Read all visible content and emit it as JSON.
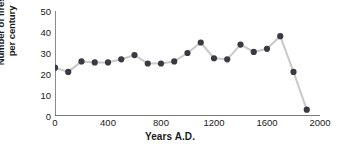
{
  "chart_data": {
    "type": "line",
    "title": "",
    "subtitle": "",
    "xlabel": "Years A.D.",
    "ylabel": "Number of fires per century",
    "ylabel_line1": "Number of fires",
    "ylabel_line2": "per century",
    "xlim": [
      0,
      2000
    ],
    "ylim": [
      0,
      50
    ],
    "xticks": [
      0,
      400,
      800,
      1200,
      1600,
      2000
    ],
    "xtick_labels": [
      "0",
      "400",
      "800",
      "1200",
      "1600",
      "2000"
    ],
    "xminor_tick_step": 100,
    "yticks": [
      0,
      10,
      20,
      30,
      40,
      50
    ],
    "ytick_labels": [
      "0",
      "10",
      "20",
      "30",
      "40",
      "50"
    ],
    "grid": false,
    "legend": false,
    "legend_position": "none",
    "marker": "filled-circle",
    "marker_color": "#3a3a42",
    "line_color": "#c9c9c9",
    "axis_color": "#4d4d4d",
    "text_color": "#1a1a1a",
    "background": "#ffffff",
    "x": [
      0,
      100,
      200,
      300,
      400,
      500,
      600,
      700,
      800,
      900,
      1000,
      1100,
      1200,
      1300,
      1400,
      1500,
      1600,
      1700,
      1800,
      1900
    ],
    "values": [
      23,
      21,
      26,
      25.5,
      25.5,
      27,
      29,
      25,
      25,
      26,
      30,
      35,
      27.5,
      27,
      34,
      30.5,
      32,
      38,
      21,
      3
    ],
    "series": [
      {
        "name": "Number of fires per century",
        "x": [
          0,
          100,
          200,
          300,
          400,
          500,
          600,
          700,
          800,
          900,
          1000,
          1100,
          1200,
          1300,
          1400,
          1500,
          1600,
          1700,
          1800,
          1900
        ],
        "values": [
          23,
          21,
          26,
          25.5,
          25.5,
          27,
          29,
          25,
          25,
          26,
          30,
          35,
          27.5,
          27,
          34,
          30.5,
          32,
          38,
          21,
          3
        ]
      }
    ]
  }
}
